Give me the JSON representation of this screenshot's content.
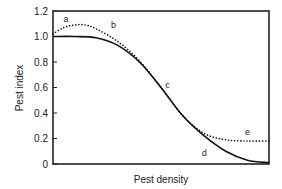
{
  "chart_data": {
    "type": "line",
    "title": "",
    "xlabel": "Pest density",
    "ylabel": "Pest index",
    "ylim": [
      0,
      1.2
    ],
    "xlim": [
      0,
      1
    ],
    "yticks": [
      "0",
      "0.2",
      "0.4",
      "0.6",
      "0.8",
      "1.0",
      "1.2"
    ],
    "ytick_values": [
      0,
      0.2,
      0.4,
      0.6,
      0.8,
      1.0,
      1.2
    ],
    "grid": false,
    "legend": "none",
    "series": [
      {
        "name": "solid",
        "style": "solid",
        "x": [
          0,
          0.1,
          0.2,
          0.3,
          0.4,
          0.5,
          0.6,
          0.7,
          0.8,
          0.9,
          1.0
        ],
        "values": [
          1.0,
          1.0,
          0.99,
          0.93,
          0.8,
          0.6,
          0.38,
          0.22,
          0.1,
          0.03,
          0.01
        ]
      },
      {
        "name": "dotted",
        "style": "dotted",
        "x": [
          0,
          0.05,
          0.1,
          0.15,
          0.2,
          0.3,
          0.4,
          0.5,
          0.6,
          0.7,
          0.8,
          0.9,
          1.0
        ],
        "values": [
          1.02,
          1.07,
          1.09,
          1.09,
          1.06,
          0.96,
          0.81,
          0.6,
          0.38,
          0.24,
          0.19,
          0.18,
          0.18
        ]
      }
    ],
    "annotations": [
      {
        "label": "a",
        "x": 0.06,
        "y": 1.11
      },
      {
        "label": "b",
        "x": 0.28,
        "y": 1.07
      },
      {
        "label": "c",
        "x": 0.53,
        "y": 0.6
      },
      {
        "label": "d",
        "x": 0.7,
        "y": 0.06
      },
      {
        "label": "e",
        "x": 0.9,
        "y": 0.23
      }
    ]
  }
}
